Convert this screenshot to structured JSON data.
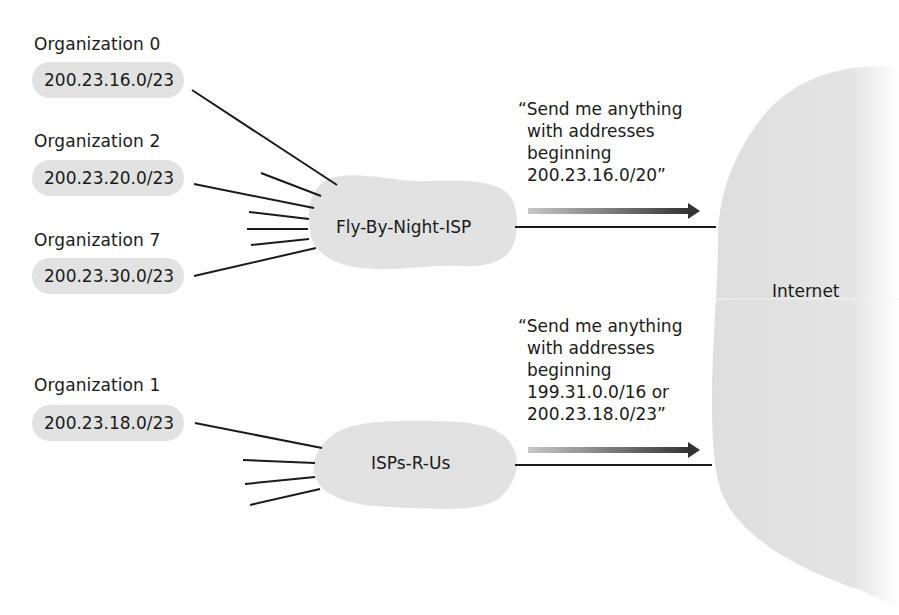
{
  "diagram": {
    "colors": {
      "cloud_fill": "#e2e2e2",
      "line": "#1a1a1a",
      "arrow_start": "#c8c8c8",
      "arrow_end": "#333333",
      "text": "#1a1a1a"
    },
    "organizations": [
      {
        "name": "Organization 0",
        "prefix": "200.23.16.0/23"
      },
      {
        "name": "Organization 2",
        "prefix": "200.23.20.0/23"
      },
      {
        "name": "Organization 7",
        "prefix": "200.23.30.0/23"
      },
      {
        "name": "Organization 1",
        "prefix": "200.23.18.0/23"
      }
    ],
    "isps": [
      {
        "name": "Fly-By-Night-ISP"
      },
      {
        "name": "ISPs-R-Us"
      }
    ],
    "internet": {
      "label": "Internet"
    },
    "announcements": [
      {
        "lines": [
          "“Send me anything",
          "with addresses",
          "beginning",
          "200.23.16.0/20”"
        ]
      },
      {
        "lines": [
          "“Send me anything",
          "with addresses",
          "beginning",
          "199.31.0.0/16 or",
          "200.23.18.0/23”"
        ]
      }
    ]
  }
}
